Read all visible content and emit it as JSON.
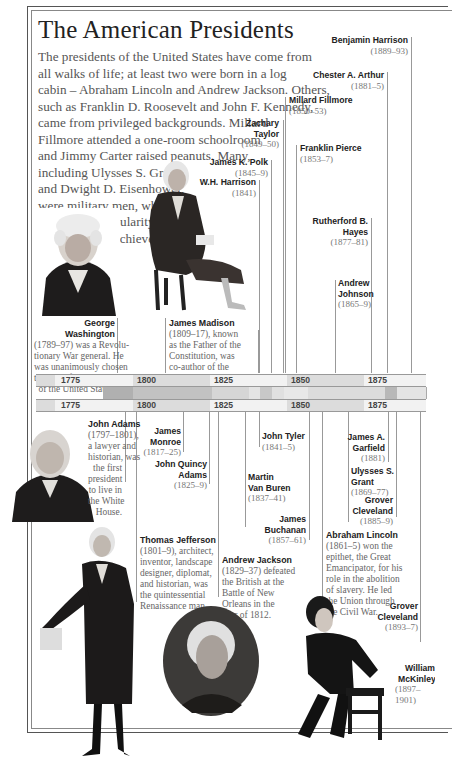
{
  "title": "The American Presidents",
  "intro_lines": [
    "The presidents of the United States have come from",
    "all walks of life; at least two were born in a log",
    "cabin – Abraham Lincoln and Andrew Jackson. Others,",
    "such as Franklin D. Roosevelt and John F. Kennedy,",
    "came from privileged backgrounds. Millard",
    "Fillmore attended a one-room schoolroom",
    "and Jimmy Carter raised peanuts. Many,",
    "including Ulysses S. Grant",
    "and Dwight D. Eisenhower,",
    "were military men, who",
    "won public popularity",
    "for their great achieve-",
    "ments in battle."
  ],
  "timeline": {
    "ticks": [
      "1775",
      "1800",
      "1825",
      "1850",
      "1875"
    ],
    "colors": {
      "light": "#f2f2f2",
      "mid": "#dcdcdc",
      "dark": "#b4b4b4",
      "term_light": "#d9d9d9",
      "term_dark": "#b0b0b0"
    }
  },
  "upper_presidents": [
    {
      "name": "Benjamin Harrison",
      "term": "(1889–93)"
    },
    {
      "name": "Chester A. Arthur",
      "term": "(1881–5)"
    },
    {
      "name": "Millard Fillmore",
      "term": "(1850–53)"
    },
    {
      "name": "Zachary Taylor",
      "term": "(1849–50)"
    },
    {
      "name": "Franklin Pierce",
      "term": "(1853–7)"
    },
    {
      "name": "James K. Polk",
      "term": "(1845–9)"
    },
    {
      "name": "W.H. Harrison",
      "term": "(1841)"
    },
    {
      "name": "Rutherford B. Hayes",
      "term": "(1877–81)"
    },
    {
      "name": "Andrew Johnson",
      "term": "(1865–9)"
    }
  ],
  "upper_features": {
    "washington": {
      "name": "George Washington",
      "text": [
        "(1789–97) was a Revolu-",
        "tionary War general. He",
        "was unanimously chosen",
        "to be the first president",
        "of the United States."
      ]
    },
    "madison": {
      "name": "James Madison",
      "text": [
        "(1809–17), known",
        "as the Father of the",
        "Constitution, was",
        "co-author of the",
        "Federalist Papers."
      ]
    }
  },
  "lower_presidents": [
    {
      "name": "James Monroe",
      "term": "(1817–25)"
    },
    {
      "name": "John Quincy Adams",
      "term": "(1825–9)"
    },
    {
      "name": "John Tyler",
      "term": "(1841–5)"
    },
    {
      "name": "Martin Van Buren",
      "term": "(1837–41)"
    },
    {
      "name": "James Buchanan",
      "term": "(1857–61)"
    },
    {
      "name": "James A. Garfield",
      "term": "(1881)"
    },
    {
      "name": "Ulysses S. Grant",
      "term": "(1869–77)"
    },
    {
      "name": "Grover Cleveland",
      "term": "(1885–9)"
    },
    {
      "name": "Grover Cleveland",
      "term": "(1893–7)"
    },
    {
      "name": "William McKinley",
      "term": "(1897–1901)"
    }
  ],
  "lower_features": {
    "adams": {
      "name": "John Adams",
      "text": [
        "(1797–1801),",
        "a lawyer and",
        "historian, was",
        "the first",
        "president",
        "to live in",
        "the White",
        "House."
      ]
    },
    "jefferson": {
      "name": "Thomas Jefferson",
      "text": [
        "(1801–9), architect,",
        "inventor, landscape",
        "designer, diplomat,",
        "and historian, was",
        "the quintessential",
        "Renaissance man."
      ]
    },
    "jackson": {
      "name": "Andrew Jackson",
      "text": [
        "(1829–37) defeated",
        "the British at the",
        "Battle of New",
        "Orleans in the",
        "War of 1812."
      ]
    },
    "lincoln": {
      "name": "Abraham Lincoln",
      "text": [
        "(1861–5) won the",
        "epithet, the Great",
        "Emancipator, for his",
        "role in the abolition",
        "of slavery. He led",
        "the Union through",
        "the Civil War."
      ]
    }
  },
  "portraits": [
    "George Washington",
    "James Madison",
    "John Adams",
    "Thomas Jefferson",
    "Andrew Jackson",
    "Abraham Lincoln"
  ]
}
